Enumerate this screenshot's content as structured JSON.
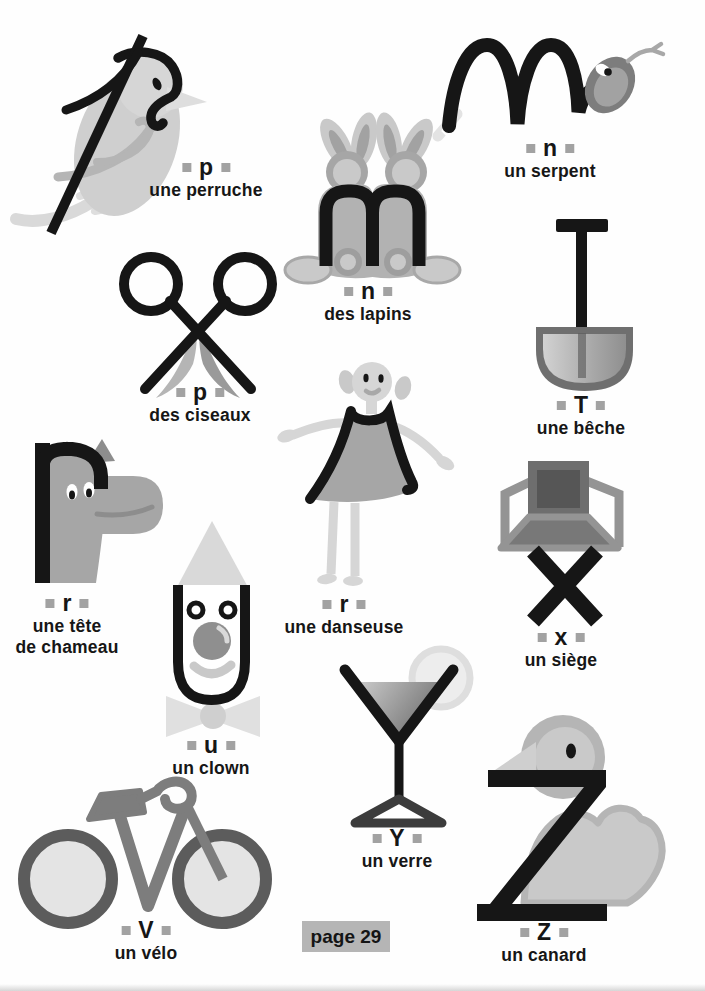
{
  "page": {
    "label": "page 29"
  },
  "palette": {
    "ink": "#161616",
    "dark_gray": "#5c5c5c",
    "mid_gray": "#a2a2a2",
    "light_gray": "#c9c9c9",
    "pale_gray": "#e3e3e3",
    "marker_square": "#a2a2a2",
    "page_box_bg": "#b5b5b5",
    "background": "#fefefe"
  },
  "items": [
    {
      "id": "perruche",
      "letter": "p",
      "caption1": "une perruche",
      "illustration": "parakeet"
    },
    {
      "id": "lapins",
      "letter": "n",
      "caption1": "des lapins",
      "illustration": "rabbits"
    },
    {
      "id": "serpent",
      "letter": "n",
      "caption1": "un serpent",
      "illustration": "snake"
    },
    {
      "id": "ciseaux",
      "letter": "p",
      "caption1": "des ciseaux",
      "illustration": "scissors"
    },
    {
      "id": "beche",
      "letter": "T",
      "caption1": "une bêche",
      "illustration": "spade"
    },
    {
      "id": "chameau",
      "letter": "r",
      "caption1": "une tête",
      "caption2": "de chameau",
      "illustration": "camel-head"
    },
    {
      "id": "danseuse",
      "letter": "r",
      "caption1": "une danseuse",
      "illustration": "dancer"
    },
    {
      "id": "siege",
      "letter": "x",
      "caption1": "un siège",
      "illustration": "chair"
    },
    {
      "id": "clown",
      "letter": "u",
      "caption1": "un clown",
      "illustration": "clown"
    },
    {
      "id": "verre",
      "letter": "Y",
      "caption1": "un verre",
      "illustration": "martini-glass"
    },
    {
      "id": "velo",
      "letter": "V",
      "caption1": "un vélo",
      "illustration": "bicycle"
    },
    {
      "id": "canard",
      "letter": "Z",
      "caption1": "un canard",
      "illustration": "duck"
    }
  ]
}
